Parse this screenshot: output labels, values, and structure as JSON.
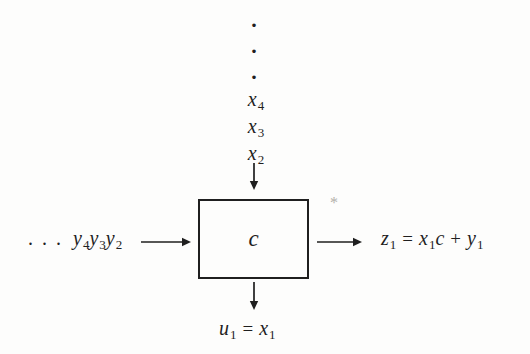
{
  "colors": {
    "background": "#fdfdfc",
    "ink": "#1f1f1f",
    "artifact": "#b3b0aa"
  },
  "top_stream": {
    "ellipsis_dot": "·",
    "items": [
      {
        "var": "x",
        "sub": "4"
      },
      {
        "var": "x",
        "sub": "3"
      },
      {
        "var": "x",
        "sub": "2"
      }
    ]
  },
  "left_stream": {
    "ellipsis": ". . .",
    "terms": [
      {
        "var": "y",
        "sub": "4"
      },
      {
        "var": "y",
        "sub": "3"
      },
      {
        "var": "y",
        "sub": "2"
      }
    ]
  },
  "cell": {
    "label": "c"
  },
  "right_output": {
    "lhs_var": "z",
    "lhs_sub": "1",
    "equals": "=",
    "term_var": "x",
    "term_sub": "1",
    "term_factor": "c",
    "plus": "+",
    "addend_var": "y",
    "addend_sub": "1"
  },
  "bottom_output": {
    "lhs_var": "u",
    "lhs_sub": "1",
    "equals": "=",
    "rhs_var": "x",
    "rhs_sub": "1"
  },
  "artifact_mark": "*"
}
